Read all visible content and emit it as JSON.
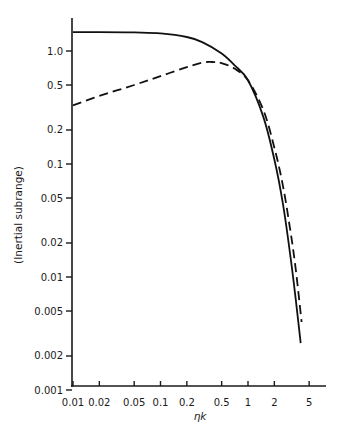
{
  "chart_data": {
    "type": "line",
    "title": "",
    "xlabel": "ηk",
    "ylabel": "(Inertial subrange)",
    "xscale": "log",
    "yscale": "log",
    "xlim": [
      0.01,
      7
    ],
    "ylim": [
      0.001,
      1.8
    ],
    "grid": false,
    "legend": null,
    "x_ticks": [
      0.01,
      0.02,
      0.05,
      0.1,
      0.2,
      0.5,
      1,
      2,
      5
    ],
    "x_tick_labels": [
      "0.01",
      "0.02",
      "0.05",
      "0.1",
      "0.2",
      "0.5",
      "1",
      "2",
      "5"
    ],
    "y_ticks": [
      1.0,
      0.5,
      0.2,
      0.1,
      0.05,
      0.02,
      0.01,
      0.005,
      0.002,
      0.001
    ],
    "y_tick_labels": [
      "1.0",
      "0.5",
      "0.2",
      "0.1",
      "0.05",
      "0.02",
      "0.01",
      "0.005",
      "0.002",
      "0.001"
    ],
    "series": [
      {
        "name": "solid",
        "style": "solid",
        "x": [
          0.01,
          0.02,
          0.05,
          0.1,
          0.2,
          0.3,
          0.5,
          0.7,
          1.0,
          1.5,
          2.0,
          2.5,
          3.0,
          3.5,
          4.0
        ],
        "y": [
          1.47,
          1.47,
          1.46,
          1.43,
          1.33,
          1.2,
          0.95,
          0.75,
          0.55,
          0.26,
          0.11,
          0.045,
          0.017,
          0.0065,
          0.0026
        ]
      },
      {
        "name": "dashed",
        "style": "dashed",
        "x": [
          0.01,
          0.02,
          0.05,
          0.1,
          0.2,
          0.3,
          0.4,
          0.5,
          0.7,
          1.0,
          1.5,
          2.0,
          2.5,
          3.0,
          3.5,
          4.1
        ],
        "y": [
          0.33,
          0.4,
          0.5,
          0.6,
          0.72,
          0.79,
          0.8,
          0.78,
          0.7,
          0.55,
          0.3,
          0.14,
          0.065,
          0.028,
          0.012,
          0.004
        ]
      }
    ]
  }
}
